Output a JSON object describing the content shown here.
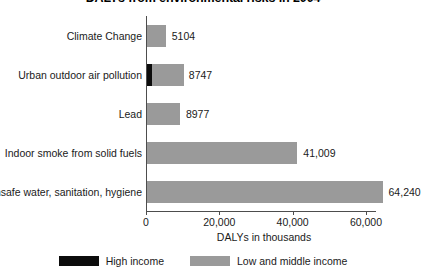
{
  "chart_data": {
    "type": "bar",
    "orientation": "horizontal",
    "stacked": true,
    "title": "DALYs from environmental risks in 2004",
    "xlabel": "DALYs in thousands",
    "ylabel": "",
    "xlim": [
      0,
      65500
    ],
    "xticks": [
      0,
      20000,
      40000,
      60000
    ],
    "xtick_labels": [
      "0",
      "20,000",
      "40,000",
      "60,000"
    ],
    "grid": false,
    "legend_position": "bottom",
    "categories": [
      "Climate Change",
      "Urban outdoor air pollution",
      "Lead",
      "Indoor smoke from solid fuels",
      "Unsafe water, sanitation, hygiene"
    ],
    "series": [
      {
        "name": "High income",
        "color": "#0c0c0c",
        "values": [
          0,
          1029,
          0,
          0,
          0
        ],
        "labels": [
          "",
          "1029",
          "",
          "",
          ""
        ]
      },
      {
        "name": "Low and middle income",
        "color": "#9a9a9a",
        "values": [
          5104,
          8747,
          8977,
          41009,
          64240
        ],
        "labels": [
          "5104",
          "8747",
          "8977",
          "41,009",
          "64,240"
        ]
      }
    ],
    "rows": [
      {
        "category": "Climate Change",
        "high_income": 0,
        "high_income_label": "",
        "low_middle_income": 5104,
        "total_label": "5104"
      },
      {
        "category": "Urban outdoor air pollution",
        "high_income": 1029,
        "high_income_label": "1029",
        "low_middle_income": 8747,
        "total_label": "8747"
      },
      {
        "category": "Lead",
        "high_income": 0,
        "high_income_label": "",
        "low_middle_income": 8977,
        "total_label": "8977"
      },
      {
        "category": "Indoor smoke from solid fuels",
        "high_income": 0,
        "high_income_label": "",
        "low_middle_income": 41009,
        "total_label": "41,009"
      },
      {
        "category": "Unsafe water, sanitation, hygiene",
        "high_income": 0,
        "high_income_label": "",
        "low_middle_income": 64240,
        "total_label": "64,240"
      }
    ],
    "legend": [
      {
        "label": "High income",
        "color": "#0c0c0c"
      },
      {
        "label": "Low and middle income",
        "color": "#9a9a9a"
      }
    ]
  }
}
